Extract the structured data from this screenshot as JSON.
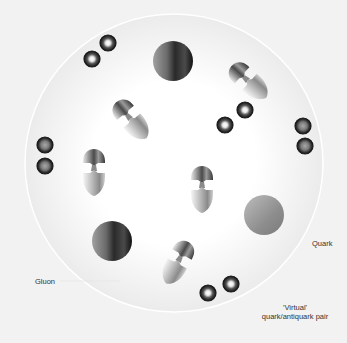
{
  "diagram": {
    "background": "#f2f2f2",
    "container": {
      "cx": 174,
      "cy": 163,
      "r": 149,
      "fill_center": "#ffffff",
      "fill_edge": "#ececec",
      "stroke": "#ffffff"
    },
    "labels": {
      "quark": "Quark",
      "gluon": "Gluon",
      "virtual_line1": "'Virtual'",
      "virtual_line2": "quark/antiquark pair"
    },
    "quarks": [
      {
        "cx": 173,
        "cy": 61,
        "r": 20
      },
      {
        "cx": 112,
        "cy": 241,
        "r": 20
      },
      {
        "cx": 264,
        "cy": 215,
        "r": 20,
        "style": "light"
      }
    ],
    "gluons": [
      {
        "x": 128,
        "y": 116,
        "angle": -40
      },
      {
        "x": 94,
        "y": 167,
        "angle": 0
      },
      {
        "x": 202,
        "y": 184,
        "angle": 0
      },
      {
        "x": 245,
        "y": 78,
        "angle": -48
      },
      {
        "x": 180,
        "y": 258,
        "angle": 28
      }
    ],
    "virtual_pairs": [
      {
        "a": [
          92,
          59
        ],
        "b": [
          108,
          43
        ],
        "style": "bright"
      },
      {
        "a": [
          225,
          125
        ],
        "b": [
          245,
          110
        ],
        "style": "bright"
      },
      {
        "a": [
          208,
          293
        ],
        "b": [
          231,
          284
        ],
        "style": "bright"
      },
      {
        "a": [
          45,
          145
        ],
        "b": [
          45,
          166
        ],
        "style": "gray"
      },
      {
        "a": [
          303,
          126
        ],
        "b": [
          305,
          146
        ],
        "style": "gray"
      }
    ],
    "colors": {
      "bead_ring": "#1a1a1a",
      "bead_core": "#ffffff",
      "bead_gray_core": "#9a9a9a",
      "quark_dark": "#1c1c1c",
      "quark_light": "#9c9c9c"
    }
  }
}
